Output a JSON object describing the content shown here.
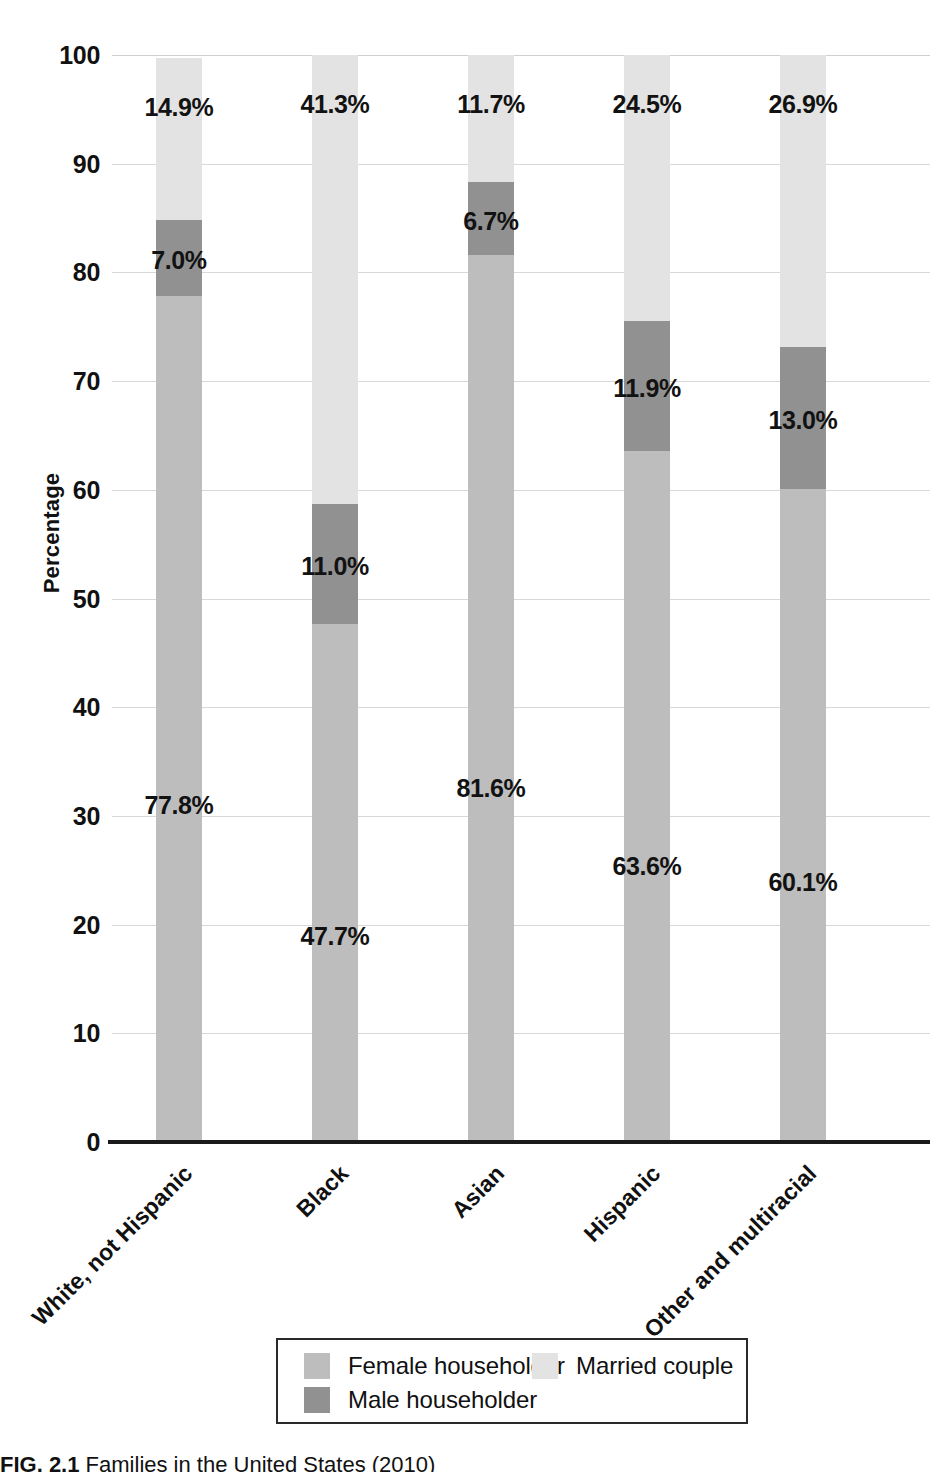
{
  "chart_data": {
    "type": "bar",
    "subtype": "stacked-bar-100",
    "title": "Families in the United States (2010)",
    "xlabel": "",
    "ylabel": "Percentage",
    "ylim": [
      0,
      100
    ],
    "ytick_values": [
      0,
      10,
      20,
      30,
      40,
      50,
      60,
      70,
      80,
      90,
      100
    ],
    "ytick_labels": [
      "0",
      "10",
      "20",
      "30",
      "40",
      "50",
      "60",
      "70",
      "80",
      "90",
      "100"
    ],
    "grid": true,
    "legend_position": "bottom",
    "categories": [
      "White, not Hispanic",
      "Black",
      "Asian",
      "Hispanic",
      "Other and multiracial"
    ],
    "series": [
      {
        "name": "Female householder",
        "color": "#bdbdbd",
        "values": [
          77.8,
          47.7,
          81.6,
          63.6,
          60.1
        ],
        "labels": [
          "77.8%",
          "47.7%",
          "81.6%",
          "63.6%",
          "60.1%"
        ]
      },
      {
        "name": "Male householder",
        "color": "#919191",
        "values": [
          7.0,
          11.0,
          6.7,
          11.9,
          13.0
        ],
        "labels": [
          "7.0%",
          "11.0%",
          "6.7%",
          "11.9%",
          "13.0%"
        ]
      },
      {
        "name": "Married couple",
        "color": "#e3e3e3",
        "values": [
          14.9,
          41.3,
          11.7,
          24.5,
          26.9
        ],
        "labels": [
          "14.9%",
          "41.3%",
          "11.7%",
          "24.5%",
          "26.9%"
        ]
      }
    ]
  },
  "axis": {
    "y_title": "Percentage"
  },
  "legend": {
    "items": [
      {
        "label": "Female householder",
        "color": "#bdbdbd"
      },
      {
        "label": "Married couple",
        "color": "#e3e3e3"
      },
      {
        "label": "Male householder",
        "color": "#919191"
      }
    ]
  },
  "caption": {
    "figure_number": "FIG. 2.1",
    "text": "Families in the United States (2010)"
  }
}
